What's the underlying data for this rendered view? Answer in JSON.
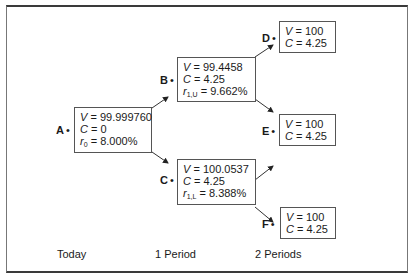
{
  "diagram": {
    "type": "binomial-interest-rate-tree",
    "nodes": [
      {
        "id": "A",
        "label": "A",
        "lines": [
          {
            "var": "V",
            "value": "99.999760"
          },
          {
            "var": "C",
            "value": "0"
          },
          {
            "var": "r",
            "sub": "0",
            "value": "8.000%"
          }
        ]
      },
      {
        "id": "B",
        "label": "B",
        "lines": [
          {
            "var": "V",
            "value": "99.4458"
          },
          {
            "var": "C",
            "value": "4.25"
          },
          {
            "var": "r",
            "sub": "1,U",
            "value": "9.662%"
          }
        ]
      },
      {
        "id": "C",
        "label": "C",
        "lines": [
          {
            "var": "V",
            "value": "100.0537"
          },
          {
            "var": "C",
            "value": "4.25"
          },
          {
            "var": "r",
            "sub": "1,L",
            "value": "8.388%"
          }
        ]
      },
      {
        "id": "D",
        "label": "D",
        "lines": [
          {
            "var": "V",
            "value": "100"
          },
          {
            "var": "C",
            "value": "4.25"
          }
        ]
      },
      {
        "id": "E",
        "label": "E",
        "lines": [
          {
            "var": "V",
            "value": "100"
          },
          {
            "var": "C",
            "value": "4.25"
          }
        ]
      },
      {
        "id": "F",
        "label": "F",
        "lines": [
          {
            "var": "V",
            "value": "100"
          },
          {
            "var": "C",
            "value": "4.25"
          }
        ]
      }
    ],
    "edges": [
      [
        "A",
        "B"
      ],
      [
        "A",
        "C"
      ],
      [
        "B",
        "D"
      ],
      [
        "B",
        "E"
      ],
      [
        "C",
        "E"
      ],
      [
        "C",
        "F"
      ]
    ],
    "periods": [
      "Today",
      "1 Period",
      "2 Periods"
    ]
  },
  "nodeA": {
    "label": "A",
    "v": "99.999760",
    "c": "0",
    "r_sub": "0",
    "r": "8.000%"
  },
  "nodeB": {
    "label": "B",
    "v": "99.4458",
    "c": "4.25",
    "r_sub": "1,U",
    "r": "9.662%"
  },
  "nodeC": {
    "label": "C",
    "v": "100.0537",
    "c": "4.25",
    "r_sub": "1,L",
    "r": "8.388%"
  },
  "nodeD": {
    "label": "D",
    "v": "100",
    "c": "4.25"
  },
  "nodeE": {
    "label": "E",
    "v": "100",
    "c": "4.25"
  },
  "nodeF": {
    "label": "F",
    "v": "100",
    "c": "4.25"
  },
  "periods": {
    "p0": "Today",
    "p1": "1 Period",
    "p2": "2 Periods"
  },
  "symbols": {
    "v": "V",
    "c": "C",
    "r": "r",
    "eq": " = ",
    "dot": "•"
  }
}
